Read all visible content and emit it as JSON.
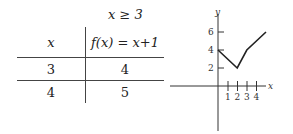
{
  "table": {
    "condition": "x ≥ 3",
    "headers": [
      "x",
      "f(x) = x+1"
    ],
    "rows": [
      [
        "3",
        "4"
      ],
      [
        "4",
        "5"
      ]
    ]
  },
  "chart_data": {
    "type": "line",
    "title": "",
    "xlabel": "x",
    "ylabel": "y",
    "x_ticks": [
      "1",
      "2",
      "3",
      "4"
    ],
    "y_ticks": [
      "2",
      "4",
      "6"
    ],
    "x": [
      0,
      2,
      3,
      5
    ],
    "values": [
      4,
      2,
      4,
      6
    ],
    "xlim": [
      -5,
      5
    ],
    "ylim": [
      -5,
      7
    ],
    "grid": false,
    "colors": {
      "line": "#222222",
      "axis": "#333333"
    }
  }
}
